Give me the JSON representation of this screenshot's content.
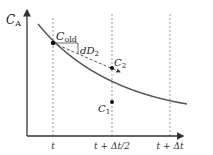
{
  "diagram": {
    "y_axis_label": "C",
    "y_axis_sub": "A",
    "ticks": [
      "t",
      "t + Δt/2",
      "t + Δt"
    ],
    "points": {
      "c_old": {
        "label": "C",
        "sub": "old"
      },
      "c2": {
        "label": "C",
        "sub": "2"
      },
      "c1": {
        "label": "C",
        "sub": "1"
      }
    },
    "slope_label": {
      "prefix": "dD",
      "sub": "2"
    },
    "colors": {
      "curve": "#555555",
      "axis": "#333333",
      "guide": "#999999",
      "point": "#111111"
    }
  }
}
